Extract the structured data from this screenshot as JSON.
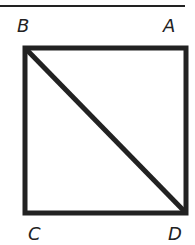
{
  "diagram": {
    "type": "square with diagonal",
    "labels": {
      "top_left": "B",
      "top_right": "A",
      "bottom_left": "C",
      "bottom_right": "D"
    },
    "diagonal": "B-D",
    "colors": {
      "stroke": "#222222",
      "background": "#ffffff"
    }
  }
}
